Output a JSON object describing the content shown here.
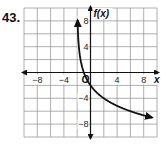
{
  "problem": {
    "number": "43."
  },
  "chart_data": {
    "type": "line",
    "title": "",
    "xlabel": "x",
    "ylabel": "f(x)",
    "xlim": [
      -10,
      10
    ],
    "ylim": [
      -10,
      10
    ],
    "grid": true,
    "grid_step": 2,
    "x_ticks": [
      -8,
      -4,
      4,
      8
    ],
    "y_ticks": [
      8,
      4,
      -4,
      -8
    ],
    "x_tick_labels": [
      "−8",
      "−4",
      "4",
      "8"
    ],
    "y_tick_labels": [
      "8",
      "4",
      "−4",
      "−8"
    ],
    "origin_label": "O",
    "series": [
      {
        "name": "f(x)",
        "vertical_asymptote": -2,
        "x": [
          -1.9,
          -1.8,
          -1.5,
          -1,
          0,
          1,
          2,
          4,
          6,
          8,
          9
        ],
        "y": [
          10,
          6.6,
          2.0,
          0,
          -2,
          -3.2,
          -4,
          -5.2,
          -6,
          -6.6,
          -6.9
        ],
        "arrows": "both ends"
      }
    ]
  }
}
